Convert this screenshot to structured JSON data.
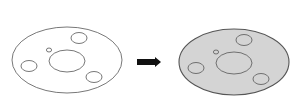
{
  "diagram": {
    "colors": {
      "background": "#ffffff",
      "stroke": "#555555",
      "fill_after": "#d4d4d4",
      "arrow": "#111111"
    },
    "before": {
      "label": "outline-flange",
      "outer": {
        "cx": 67,
        "cy": 60,
        "rx": 55,
        "ry": 33
      },
      "center_hole": {
        "cx": 67,
        "cy": 61,
        "rx": 18,
        "ry": 11
      },
      "small_hole": {
        "cx": 49,
        "cy": 50,
        "rx": 2.6,
        "ry": 2
      },
      "bolt_holes": [
        {
          "cx": 79,
          "cy": 38,
          "rx": 8,
          "ry": 5.5
        },
        {
          "cx": 29,
          "cy": 66,
          "rx": 8,
          "ry": 5.5
        },
        {
          "cx": 94,
          "cy": 77,
          "rx": 8,
          "ry": 5.5
        }
      ]
    },
    "arrow": {
      "x1": 137,
      "y1": 62,
      "x2": 161,
      "y2": 62
    },
    "after": {
      "label": "filled-flange",
      "outer": {
        "cx": 234,
        "cy": 62,
        "rx": 55,
        "ry": 33
      },
      "center_hole": {
        "cx": 234,
        "cy": 63,
        "rx": 18,
        "ry": 11
      },
      "small_hole": {
        "cx": 216,
        "cy": 52,
        "rx": 2.6,
        "ry": 2
      },
      "bolt_holes": [
        {
          "cx": 244,
          "cy": 40,
          "rx": 8,
          "ry": 5.5
        },
        {
          "cx": 196,
          "cy": 68,
          "rx": 8,
          "ry": 5.5
        },
        {
          "cx": 261,
          "cy": 79,
          "rx": 8,
          "ry": 5.5
        }
      ]
    }
  }
}
